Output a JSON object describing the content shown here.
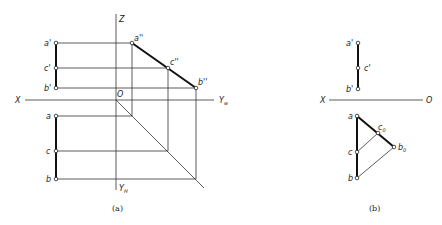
{
  "figure_a": {
    "caption": "(a)",
    "axes": {
      "z": "Z",
      "x": "X",
      "origin": "O",
      "yw": "Yw",
      "yw_sub": "w",
      "yh": "YH",
      "yh_sub": "H"
    },
    "labels": {
      "a_prime": "a'",
      "c_prime": "c'",
      "b_prime": "b'",
      "a_dprime": "a''",
      "c_dprime": "c''",
      "b_dprime": "b''",
      "a": "a",
      "c": "c",
      "b": "b"
    }
  },
  "figure_b": {
    "caption": "(b)",
    "axes": {
      "x": "X",
      "origin": "O"
    },
    "labels": {
      "a_prime": "a'",
      "c_prime": "c'",
      "b_prime": "b'",
      "a": "a",
      "c": "c",
      "b": "b",
      "c0": "c",
      "c0_sub": "0",
      "b0": "b",
      "b0_sub": "0"
    }
  }
}
